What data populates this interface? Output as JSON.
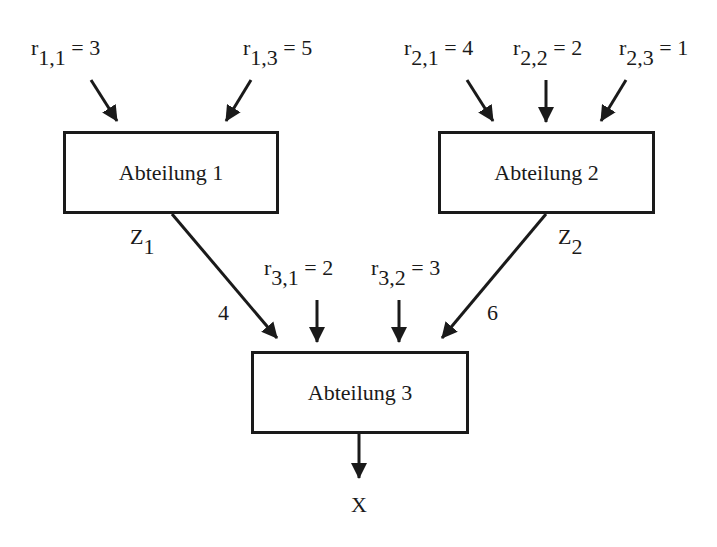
{
  "diagram": {
    "departments": [
      {
        "id": "1",
        "label": "Abteilung 1"
      },
      {
        "id": "2",
        "label": "Abteilung 2"
      },
      {
        "id": "3",
        "label": "Abteilung 3"
      }
    ],
    "inputs": [
      {
        "var": "r",
        "sub": "1,1",
        "eq": " = 3",
        "target": "Abteilung 1"
      },
      {
        "var": "r",
        "sub": "1,3",
        "eq": " = 5",
        "target": "Abteilung 1"
      },
      {
        "var": "r",
        "sub": "2,1",
        "eq": " = 4",
        "target": "Abteilung 2"
      },
      {
        "var": "r",
        "sub": "2,2",
        "eq": " = 2",
        "target": "Abteilung 2"
      },
      {
        "var": "r",
        "sub": "2,3",
        "eq": " = 1",
        "target": "Abteilung 2"
      },
      {
        "var": "r",
        "sub": "3,1",
        "eq": " = 2",
        "target": "Abteilung 3"
      },
      {
        "var": "r",
        "sub": "3,2",
        "eq": " = 3",
        "target": "Abteilung 3"
      }
    ],
    "intermediates": [
      {
        "var": "Z",
        "sub": "1",
        "qty": "4",
        "from": "Abteilung 1",
        "to": "Abteilung 3"
      },
      {
        "var": "Z",
        "sub": "2",
        "qty": "6",
        "from": "Abteilung 2",
        "to": "Abteilung 3"
      }
    ],
    "output": {
      "label": "X",
      "from": "Abteilung 3"
    },
    "line_color": "#1a1a1a"
  }
}
